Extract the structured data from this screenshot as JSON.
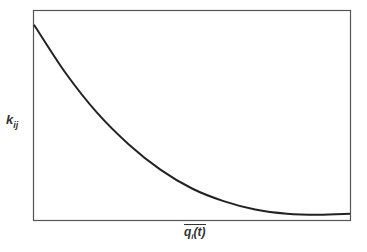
{
  "chart_data": {
    "type": "line",
    "title": "",
    "xlabel": "q_i(t) (overline)",
    "ylabel": "k_ij",
    "x_ticks": [],
    "y_ticks": [],
    "grid": false,
    "legend": null,
    "series": [
      {
        "name": "k_ij vs mean q_i(t)",
        "description": "monotonically decreasing convex curve flattening near bottom",
        "x_norm": [
          0.0,
          0.1,
          0.2,
          0.3,
          0.4,
          0.5,
          0.6,
          0.7,
          0.8,
          0.9,
          1.0
        ],
        "y_norm": [
          0.93,
          0.7,
          0.51,
          0.36,
          0.24,
          0.15,
          0.09,
          0.05,
          0.03,
          0.025,
          0.03
        ]
      }
    ]
  },
  "labels": {
    "y_main": "k",
    "y_sub": "ij",
    "x_main": "q",
    "x_sub": "i",
    "x_rest": "(t)"
  },
  "colors": {
    "frame": "#555555",
    "curve": "#222222"
  }
}
